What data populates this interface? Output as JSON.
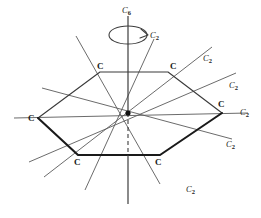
{
  "figure": {
    "background_color": "#ffffff",
    "ink_color": "#1a1a1a",
    "axis_color": "#5a5a5a"
  },
  "principal_axis": {
    "label": "C",
    "subscript": "6",
    "order": 6,
    "orientation": "vertical",
    "hidden_segment_style": "dashed",
    "rotation_arrow": "curved-arrow-clockwise"
  },
  "ring": {
    "atom_label": "C",
    "atom_count": 6,
    "atoms": [
      {
        "id": "atom-upper-left",
        "label": "C",
        "x": 100,
        "y": 72
      },
      {
        "id": "atom-upper-right",
        "label": "C",
        "x": 168,
        "y": 72
      },
      {
        "id": "atom-right",
        "label": "C",
        "x": 222,
        "y": 113
      },
      {
        "id": "atom-lower-right",
        "label": "C",
        "x": 160,
        "y": 155
      },
      {
        "id": "atom-lower-left",
        "label": "C",
        "x": 78,
        "y": 155
      },
      {
        "id": "atom-left",
        "label": "C",
        "x": 38,
        "y": 118
      }
    ]
  },
  "secondary_axes": {
    "label": "C",
    "subscript": "2",
    "count": 6,
    "items": [
      {
        "id": "c2-axis-steep-right",
        "label": "C",
        "subscript": "2",
        "label_x": 150,
        "label_y": 31
      },
      {
        "id": "c2-axis-upper-right",
        "label": "C",
        "subscript": "2",
        "label_x": 203,
        "label_y": 54
      },
      {
        "id": "c2-axis-mid-right",
        "label": "C",
        "subscript": "2",
        "label_x": 229,
        "label_y": 81
      },
      {
        "id": "c2-axis-horizontal",
        "label": "C",
        "subscript": "2",
        "label_x": 240,
        "label_y": 113
      },
      {
        "id": "c2-axis-lower-right",
        "label": "C",
        "subscript": "2",
        "label_x": 226,
        "label_y": 144
      },
      {
        "id": "c2-axis-steep-lower",
        "label": "C",
        "subscript": "2",
        "label_x": 186,
        "label_y": 185
      }
    ]
  }
}
